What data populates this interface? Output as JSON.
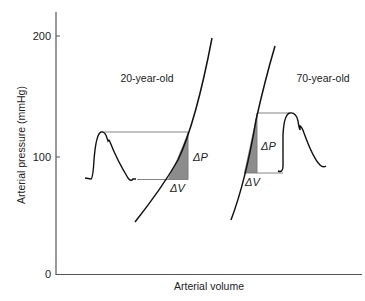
{
  "figure": {
    "ylabel": "Arterial pressure (mmHg)",
    "xlabel": "Arterial volume",
    "yticks": [
      "0",
      "100",
      "200"
    ],
    "series": [
      {
        "name": "young",
        "label": "20-year-old"
      },
      {
        "name": "old",
        "label": "70-year-old"
      }
    ],
    "annotations": {
      "young_dp": "ΔP",
      "young_dv": "ΔV",
      "old_dp": "ΔP",
      "old_dv": "ΔV"
    }
  },
  "colors": {
    "line": "#111111",
    "axis": "#555555",
    "guide": "#777777",
    "shade": "#8c8c8c"
  }
}
